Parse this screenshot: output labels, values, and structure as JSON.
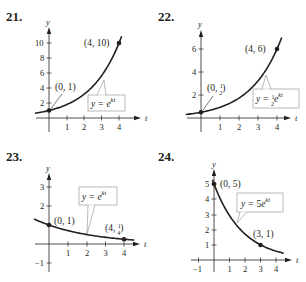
{
  "chart_data": [
    {
      "type": "line",
      "problem_number": "21.",
      "xlabel": "t",
      "ylabel": "y",
      "x_ticks": [
        "1",
        "2",
        "3",
        "4"
      ],
      "y_ticks": [
        "2",
        "4",
        "6",
        "8",
        "10"
      ],
      "equation": "y = e^{kt}",
      "equation_parts": {
        "lhs": "y = ",
        "coef": "",
        "base": "e",
        "exp": "kt"
      },
      "points": [
        {
          "x": 0,
          "y": 1,
          "label": "(0, 1)"
        },
        {
          "x": 4,
          "y": 10,
          "label": "(4, 10)"
        }
      ],
      "curve": {
        "a": 1,
        "k": 0.5756,
        "xmin": -0.8,
        "xmax": 4.15
      },
      "xlim": [
        -0.8,
        4.6
      ],
      "ylim": [
        -1,
        11
      ]
    },
    {
      "type": "line",
      "problem_number": "22.",
      "xlabel": "t",
      "ylabel": "y",
      "x_ticks": [
        "1",
        "2",
        "3",
        "4"
      ],
      "y_ticks": [
        "2",
        "4",
        "6"
      ],
      "equation": "y = (1/2)e^{kt}",
      "equation_parts": {
        "lhs": "y = ",
        "coef_num": "1",
        "coef_den": "2",
        "base": "e",
        "exp": "kt"
      },
      "points": [
        {
          "x": 0,
          "y": 0.5,
          "label": "(0, 1/2)",
          "label_main": "(0, ",
          "label_num": "1",
          "label_den": "2",
          "label_end": ")"
        },
        {
          "x": 4,
          "y": 6,
          "label": "(4, 6)"
        }
      ],
      "curve": {
        "a": 0.5,
        "k": 0.6212,
        "xmin": -0.8,
        "xmax": 4.25
      },
      "xlim": [
        -0.8,
        4.6
      ],
      "ylim": [
        -1,
        7
      ]
    },
    {
      "type": "line",
      "problem_number": "23.",
      "xlabel": "t",
      "ylabel": "y",
      "x_ticks": [
        "1",
        "2",
        "3",
        "4"
      ],
      "y_ticks": [
        "-1",
        "1",
        "2",
        "3"
      ],
      "y_tick_labels": [
        "−1",
        "",
        "2",
        "3"
      ],
      "equation": "y = e^{kt}",
      "equation_parts": {
        "lhs": "y = ",
        "coef": "",
        "base": "e",
        "exp": "kt"
      },
      "points": [
        {
          "x": 0,
          "y": 1,
          "label": "(0, 1)"
        },
        {
          "x": 4,
          "y": 0.25,
          "label": "(4, 1/4)",
          "label_main": "(4, ",
          "label_num": "1",
          "label_den": "4",
          "label_end": ")"
        }
      ],
      "curve": {
        "a": 1,
        "k": -0.3466,
        "xmin": -0.8,
        "xmax": 4.55
      },
      "xlim": [
        -0.8,
        4.6
      ],
      "ylim": [
        -1.5,
        3.8
      ]
    },
    {
      "type": "line",
      "problem_number": "24.",
      "xlabel": "t",
      "ylabel": "y",
      "x_ticks": [
        "-1",
        "1",
        "2",
        "3",
        "4"
      ],
      "x_tick_labels": [
        "−1",
        "1",
        "2",
        "3",
        "4"
      ],
      "y_ticks": [
        "1",
        "2",
        "3",
        "4",
        "5"
      ],
      "equation": "y = 5e^{kt}",
      "equation_parts": {
        "lhs": "y = ",
        "coef": "5",
        "base": "e",
        "exp": "kt"
      },
      "points": [
        {
          "x": 0,
          "y": 5,
          "label": "(0, 5)"
        },
        {
          "x": 3,
          "y": 1,
          "label": "(3, 1)"
        }
      ],
      "curve": {
        "a": 5,
        "k": -0.5365,
        "xmin": -0.1,
        "xmax": 4.5
      },
      "xlim": [
        -1.3,
        4.7
      ],
      "ylim": [
        -0.6,
        5.7
      ]
    }
  ],
  "colors": {
    "ink": "#231f20",
    "box_border": "#9a9a9a",
    "leader": "#8a8a8a"
  }
}
